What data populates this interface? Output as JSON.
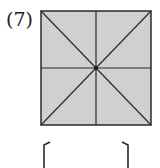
{
  "problem": {
    "number_label": "(7)"
  },
  "figure": {
    "shape": "square",
    "fill_color": "#d0d0d0",
    "stroke_color": "#2a2a2a",
    "lines": [
      "vertical-midline",
      "horizontal-midline",
      "diagonal-tl-br",
      "diagonal-tr-bl"
    ],
    "center_dot": true
  },
  "answer_box": {
    "value": ""
  }
}
